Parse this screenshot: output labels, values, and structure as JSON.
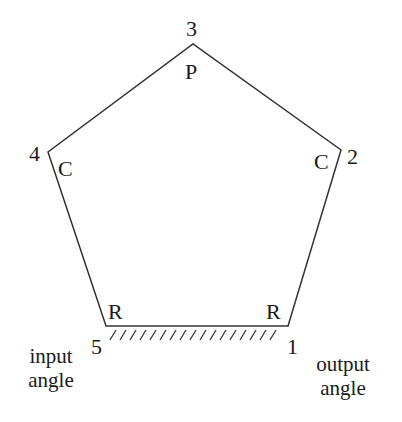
{
  "diagram": {
    "type": "five-bar linkage (pentagon)",
    "line_color": "#333333",
    "vertices": [
      {
        "id": "1",
        "x": 288,
        "y": 326
      },
      {
        "id": "2",
        "x": 341,
        "y": 150
      },
      {
        "id": "3",
        "x": 193,
        "y": 44
      },
      {
        "id": "4",
        "x": 48,
        "y": 152
      },
      {
        "id": "5",
        "x": 106,
        "y": 326
      }
    ],
    "vertex_labels": {
      "v1": "1",
      "v2": "2",
      "v3": "3",
      "v4": "4",
      "v5": "5"
    },
    "joint_labels": {
      "j1": "R",
      "j2": "C",
      "j3": "P",
      "j4": "C",
      "j5": "R"
    },
    "annotations": {
      "input": [
        "input",
        "angle"
      ],
      "output": [
        "output",
        "angle"
      ]
    },
    "ground": {
      "from_x": 106,
      "to_x": 288,
      "y": 326,
      "hatch_count": 17
    }
  }
}
